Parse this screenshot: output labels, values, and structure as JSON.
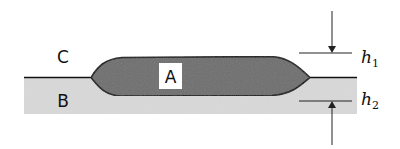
{
  "diagram": {
    "labels": {
      "region_a": "A",
      "region_b": "B",
      "region_c": "C",
      "h1": {
        "base": "h",
        "sub": "1"
      },
      "h2": {
        "base": "h",
        "sub": "2"
      }
    },
    "colors": {
      "background": "#ffffff",
      "substrate_b": "#d9d9d9",
      "lens_a": "#6e6e6e",
      "outline": "#111111",
      "label_box": "#ffffff"
    }
  }
}
